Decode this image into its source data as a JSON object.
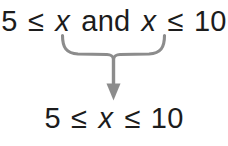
{
  "figure": {
    "background_color": "#ffffff",
    "text_color": "#1c1c1c",
    "connector_color": "#8c8c8c",
    "top_expression": {
      "left_number": "5",
      "left_relation": "≤",
      "left_variable": "x",
      "conjunction": "and",
      "right_variable": "x",
      "right_relation": "≤",
      "right_number": "10",
      "full_text": "5 ≤ x and x ≤ 10"
    },
    "bottom_expression": {
      "left_number": "5",
      "left_relation": "≤",
      "variable": "x",
      "right_relation": "≤",
      "right_number": "10",
      "full_text": "5 ≤ x ≤ 10"
    },
    "connector": {
      "brace_name": "underbrace",
      "arrow_name": "down-arrow",
      "direction": "down"
    }
  }
}
